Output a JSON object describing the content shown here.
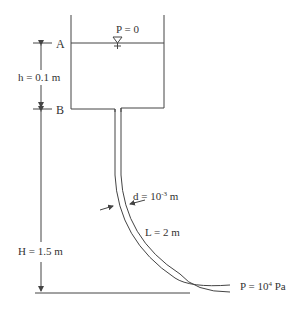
{
  "labels": {
    "point_a": "A",
    "point_b": "B",
    "surface_pressure": "P = 0",
    "height_h": "h = 0.1 m",
    "height_H": "H = 1.5 m",
    "diameter_prefix": "d = 10",
    "diameter_exp": "-3",
    "diameter_unit": " m",
    "length": "L = 2 m",
    "outlet_prefix": "P = 10",
    "outlet_exp": "4",
    "outlet_unit": " Pa"
  },
  "colors": {
    "line": "#444444",
    "text": "#333333"
  }
}
